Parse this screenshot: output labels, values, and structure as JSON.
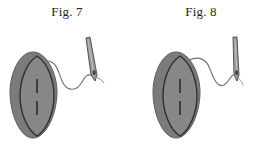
{
  "document": {
    "type": "patent-drawing-sheet",
    "background_color": "#ffffff",
    "width": 268,
    "height": 149
  },
  "palette": {
    "outer_body_fill": "#7b7b7b",
    "outer_body_stroke": "#5d5d5d",
    "inner_lens_fill": "#878787",
    "inner_lens_stroke": "#2f2f2f",
    "mark_color": "#2b2b2b",
    "needle_fill": "#9d9d9d",
    "needle_stroke": "#4a4a4a",
    "thread_color": "#6e6e6e",
    "caption_color": "#231f20"
  },
  "figures": [
    {
      "id": "fig-7",
      "caption": "Fig. 7",
      "implant": {
        "name": "lens-shaped-implant",
        "outer_body_label": "outer-body",
        "inner_lens_label": "inner-lens",
        "marks": 2
      },
      "thread": {
        "name": "suture-thread",
        "shape": "s-curve"
      },
      "needle": {
        "name": "surgical-needle",
        "orientation": "tilted",
        "eye_label": "needle-eye"
      }
    },
    {
      "id": "fig-8",
      "caption": "Fig. 8",
      "implant": {
        "name": "lens-shaped-implant",
        "outer_body_label": "outer-body",
        "inner_lens_label": "inner-lens",
        "marks": 2
      },
      "thread": {
        "name": "suture-thread",
        "shape": "arched-curve"
      },
      "needle": {
        "name": "surgical-needle",
        "orientation": "upright",
        "eye_label": "needle-eye"
      }
    }
  ]
}
